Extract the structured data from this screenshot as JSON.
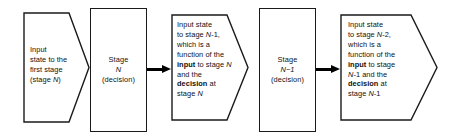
{
  "diagram": {
    "type": "flow-diagram",
    "stroke_color": "#1a1a1a",
    "arrow_color": "#000000",
    "background_color": "#ffffff",
    "nodes": [
      {
        "id": "state-1",
        "shape": "pentagon-right",
        "lines": [
          {
            "text": "Input"
          },
          {
            "text": "state to the"
          },
          {
            "text": "first stage"
          },
          {
            "text": "(stage N)",
            "emphasis": "italic-N"
          }
        ]
      },
      {
        "id": "stage-n",
        "shape": "rectangle",
        "lines": [
          {
            "text": "Stage"
          },
          {
            "text": "N",
            "emphasis": "italic"
          },
          {
            "text": "(decision)"
          }
        ]
      },
      {
        "id": "state-2",
        "shape": "pentagon-right",
        "lines": [
          {
            "text": "Input state"
          },
          {
            "text": "to stage N-1,"
          },
          {
            "text": "which  is a"
          },
          {
            "text": "function of the"
          },
          {
            "text": "input to stage N",
            "emphasis": "bold-input"
          },
          {
            "text": "and the"
          },
          {
            "text": "decision at",
            "emphasis": "bold-decision"
          },
          {
            "text": "stage N"
          }
        ]
      },
      {
        "id": "stage-n-1",
        "shape": "rectangle",
        "lines": [
          {
            "text": "Stage"
          },
          {
            "text": "N−1",
            "emphasis": "italic"
          },
          {
            "text": "(decision)"
          }
        ]
      },
      {
        "id": "state-3",
        "shape": "pentagon-right",
        "lines": [
          {
            "text": "Input state"
          },
          {
            "text": "to stage N-2,"
          },
          {
            "text": "which  is a"
          },
          {
            "text": "function of the"
          },
          {
            "text": "input to stage",
            "emphasis": "bold-input"
          },
          {
            "text": "N-1 and the"
          },
          {
            "text": "decision at",
            "emphasis": "bold-decision"
          },
          {
            "text": "stage N-1"
          }
        ]
      }
    ],
    "connectors": [
      {
        "id": "arrow-1",
        "from": "stage-n",
        "to": "state-2",
        "style": "solid-filled-arrow"
      },
      {
        "id": "arrow-2",
        "from": "stage-n-1",
        "to": "state-3",
        "style": "solid-filled-arrow"
      }
    ]
  }
}
